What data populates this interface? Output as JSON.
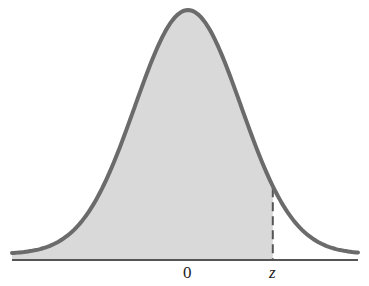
{
  "diagram": {
    "type": "normal-distribution-shaded-area",
    "labels": {
      "center": "0",
      "z": "z"
    },
    "colors": {
      "curve": "#6b6b6b",
      "fill": "#d9d9d9",
      "axis": "#555555",
      "dash": "#555555"
    },
    "shaded_region": "area under curve from left tail up to z",
    "z_value_sd": 1.6
  },
  "chart_data": {
    "type": "area",
    "title": "",
    "xlabel": "",
    "ylabel": "",
    "x_tick_labels": [
      "0",
      "z"
    ],
    "series": [
      {
        "name": "standard normal density",
        "distribution": "N(0,1)",
        "shaded_from": "-inf",
        "shaded_to": "z"
      }
    ],
    "xlim": [
      -3.3,
      3.2
    ],
    "grid": false
  }
}
